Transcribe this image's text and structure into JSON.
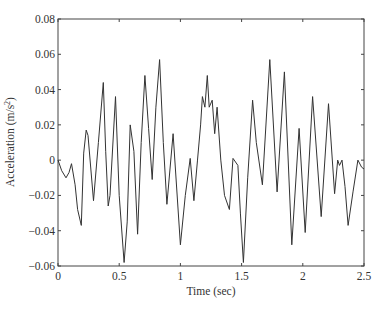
{
  "chart_data": {
    "type": "line",
    "title": "",
    "xlabel": "Time (sec)",
    "ylabel": "Acceleration (m/s²)",
    "ylabel_base": "Acceleration (m/s",
    "ylabel_sup": "2",
    "ylabel_end": ")",
    "xlim": [
      0,
      2.5
    ],
    "ylim": [
      -0.06,
      0.08
    ],
    "grid": false,
    "legend": null,
    "x_ticks": [
      0,
      0.5,
      1,
      1.5,
      2,
      2.5
    ],
    "x_tick_labels": [
      "0",
      "0.5",
      "1",
      "1.5",
      "2",
      "2.5"
    ],
    "y_ticks": [
      -0.06,
      -0.04,
      -0.02,
      0,
      0.02,
      0.04,
      0.06,
      0.08
    ],
    "y_tick_labels": [
      "-0.06",
      "-0.04",
      "-0.02",
      "0",
      "0.02",
      "0.04",
      "0.06",
      "0.08"
    ],
    "line_color": "#333333",
    "series": [
      {
        "name": "acceleration",
        "x": [
          0,
          0.03,
          0.065,
          0.09,
          0.11,
          0.14,
          0.16,
          0.19,
          0.21,
          0.23,
          0.245,
          0.29,
          0.33,
          0.37,
          0.39,
          0.41,
          0.425,
          0.47,
          0.5,
          0.54,
          0.565,
          0.59,
          0.62,
          0.65,
          0.68,
          0.71,
          0.74,
          0.77,
          0.8,
          0.83,
          0.86,
          0.89,
          0.94,
          1.0,
          1.04,
          1.08,
          1.11,
          1.14,
          1.165,
          1.18,
          1.2,
          1.22,
          1.235,
          1.26,
          1.28,
          1.3,
          1.33,
          1.36,
          1.4,
          1.43,
          1.47,
          1.49,
          1.515,
          1.55,
          1.59,
          1.62,
          1.67,
          1.73,
          1.79,
          1.85,
          1.91,
          1.97,
          2.02,
          2.08,
          2.15,
          2.21,
          2.26,
          2.285,
          2.3,
          2.32,
          2.345,
          2.37,
          2.41,
          2.45,
          2.48,
          2.5
        ],
        "y": [
          0,
          -0.006,
          -0.01,
          -0.007,
          -0.002,
          -0.014,
          -0.028,
          -0.037,
          0.004,
          0.017,
          0.014,
          -0.023,
          0.01,
          0.044,
          0.005,
          -0.026,
          -0.02,
          0.036,
          -0.02,
          -0.058,
          -0.035,
          0.02,
          0.005,
          -0.042,
          0.01,
          0.048,
          0.018,
          -0.011,
          0.03,
          0.057,
          0.01,
          -0.025,
          0.015,
          -0.048,
          -0.02,
          0.001,
          -0.023,
          0.0,
          0.02,
          0.036,
          0.03,
          0.048,
          0.03,
          0.034,
          0.015,
          0.03,
          0.0,
          -0.02,
          -0.028,
          0.001,
          -0.003,
          -0.03,
          -0.058,
          -0.01,
          0.034,
          0.01,
          -0.014,
          0.057,
          -0.018,
          0.05,
          -0.048,
          0.018,
          -0.041,
          0.036,
          -0.032,
          0.032,
          -0.019,
          0.0,
          -0.003,
          0.0,
          -0.015,
          -0.037,
          -0.018,
          0.0,
          -0.004,
          -0.005
        ]
      }
    ]
  }
}
